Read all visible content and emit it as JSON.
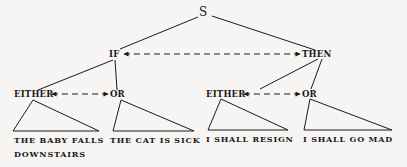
{
  "diagram": {
    "root": "S",
    "level1": {
      "left": "IF",
      "right": "THEN"
    },
    "level2": {
      "left_either": "EITHER",
      "left_or": "OR",
      "right_either": "EITHER",
      "right_or": "OR"
    },
    "leaves": {
      "leaf1_line1": "THE BABY FALLS",
      "leaf1_line2": "DOWNSTAIRS",
      "leaf2": "THE CAT IS SICK",
      "leaf3": "I SHALL RESIGN",
      "leaf4": "I SHALL GO MAD"
    },
    "relations": [
      {
        "from": "IF",
        "to": "THEN",
        "style": "dashed-double-arrow"
      },
      {
        "from": "EITHER",
        "to": "OR",
        "style": "dashed-double-arrow",
        "side": "left"
      },
      {
        "from": "EITHER",
        "to": "OR",
        "style": "dashed-double-arrow",
        "side": "right"
      }
    ]
  }
}
